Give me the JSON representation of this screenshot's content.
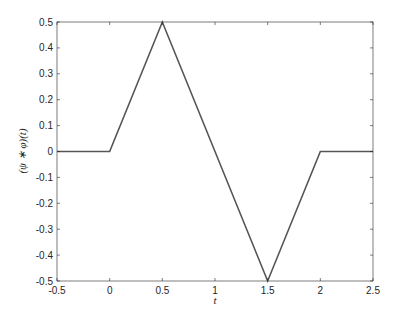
{
  "chart_data": {
    "type": "line",
    "title": "",
    "xlabel": "t",
    "ylabel": "(ψ ∗ φ)(t)",
    "xlim": [
      -0.5,
      2.5
    ],
    "ylim": [
      -0.5,
      0.5
    ],
    "grid": false,
    "legend": null,
    "x_ticks": [
      "-0.5",
      "0",
      "0.5",
      "1",
      "1.5",
      "2",
      "2.5"
    ],
    "y_ticks": [
      "0.5",
      "0.4",
      "0.3",
      "0.2",
      "0.1",
      "0",
      "-0.1",
      "-0.2",
      "-0.3",
      "-0.4",
      "-0.5"
    ],
    "series": [
      {
        "name": "(ψ∗φ)(t)",
        "color": "#555555",
        "x": [
          -0.5,
          0,
          0.5,
          1.5,
          2,
          2.5
        ],
        "y": [
          0,
          0,
          0.5,
          -0.5,
          0,
          0
        ]
      }
    ]
  }
}
